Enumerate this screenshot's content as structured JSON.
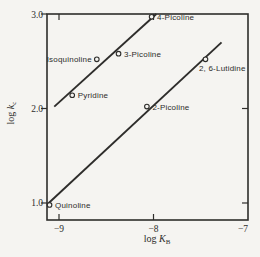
{
  "figure": {
    "background": "#f5f4f1",
    "ink": "#2e2d2b"
  },
  "axes": {
    "ylabel": {
      "prefix": "log ",
      "symbol": "k",
      "subscript": "c"
    },
    "xlabel": {
      "prefix": "log ",
      "symbol": "K",
      "subscript": "B"
    },
    "y_tick_labels": [
      "3.0",
      "2.0",
      "1.0"
    ],
    "x_tick_labels": [
      "−9",
      "−8",
      "−7"
    ]
  },
  "chart_data": {
    "type": "scatter",
    "title": "",
    "xlabel": "log K_B",
    "ylabel": "log k_c",
    "xlim": [
      -9.127,
      -7.0
    ],
    "ylim": [
      0.82,
      3.0
    ],
    "x_ticks": [
      -9,
      -8,
      -7
    ],
    "y_ticks": [
      3.0,
      2.0,
      1.0
    ],
    "grid": false,
    "points": [
      {
        "label": "Quinoline",
        "x": -9.1,
        "y": 0.98,
        "label_side": "right"
      },
      {
        "label": "Pyridine",
        "x": -8.86,
        "y": 2.14,
        "label_side": "right"
      },
      {
        "label": "Isoquinoline",
        "x": -8.6,
        "y": 2.52,
        "label_side": "left"
      },
      {
        "label": "3-Picoline",
        "x": -8.37,
        "y": 2.58,
        "label_side": "right"
      },
      {
        "label": "4-Picoline",
        "x": -8.02,
        "y": 2.97,
        "label_side": "right"
      },
      {
        "label": "2-Picoline",
        "x": -8.07,
        "y": 2.02,
        "label_side": "right"
      },
      {
        "label": "2, 6-Lutidine",
        "x": -7.45,
        "y": 2.52,
        "label_side": "below-right"
      }
    ],
    "lines": [
      {
        "name": "upper-fit-line",
        "x1": -9.05,
        "y1": 2.02,
        "x2": -7.97,
        "y2": 3.0
      },
      {
        "name": "lower-fit-line",
        "x1": -9.12,
        "y1": 0.99,
        "x2": -7.28,
        "y2": 2.7
      }
    ]
  }
}
